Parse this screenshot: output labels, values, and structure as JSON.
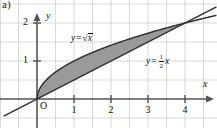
{
  "figure": {
    "part_label": "a)",
    "axis_labels": {
      "x": "x",
      "y": "y"
    },
    "origin_label": "O"
  },
  "chart_data": {
    "type": "line",
    "title": "",
    "xlabel": "x",
    "ylabel": "y",
    "xlim": [
      -0.9,
      4.85
    ],
    "ylim": [
      -0.75,
      2.55
    ],
    "xticks": [
      1,
      2,
      3,
      4
    ],
    "xtick_labels": [
      "1",
      "2",
      "3",
      "4"
    ],
    "yticks": [
      1,
      2
    ],
    "ytick_labels": [
      "1",
      "2"
    ],
    "grid": true,
    "grid_step": 0.5,
    "grid_color": "#cfcfcf",
    "axis_color": "#555555",
    "curve_color": "#333333",
    "shade_color": "#9a9a9a",
    "background": "#ffffff",
    "legend": "inline-annotations",
    "series": [
      {
        "name": "y = sqrt(x)",
        "label_text": "y = √x",
        "label_parts": {
          "lhs": "y",
          "op": "=",
          "radicand": "x"
        },
        "expression": "sqrt(x)",
        "domain": [
          0,
          4.8
        ],
        "points": [
          {
            "x": 0,
            "y": 0
          },
          {
            "x": 0.25,
            "y": 0.5
          },
          {
            "x": 0.5,
            "y": 0.707
          },
          {
            "x": 1,
            "y": 1
          },
          {
            "x": 1.5,
            "y": 1.225
          },
          {
            "x": 2,
            "y": 1.414
          },
          {
            "x": 2.5,
            "y": 1.581
          },
          {
            "x": 3,
            "y": 1.732
          },
          {
            "x": 3.5,
            "y": 1.871
          },
          {
            "x": 4,
            "y": 2
          },
          {
            "x": 4.5,
            "y": 2.121
          },
          {
            "x": 4.8,
            "y": 2.191
          }
        ]
      },
      {
        "name": "y = (1/2)x",
        "label_text": "y = ½x",
        "label_parts": {
          "lhs": "y",
          "op": "=",
          "num": "1",
          "den": "2",
          "var": "x"
        },
        "expression": "0.5*x",
        "domain": [
          -0.9,
          4.85
        ],
        "points": [
          {
            "x": -0.9,
            "y": -0.45
          },
          {
            "x": 0,
            "y": 0
          },
          {
            "x": 4,
            "y": 2
          },
          {
            "x": 4.85,
            "y": 2.425
          }
        ]
      }
    ],
    "shaded_region": {
      "label": "area between y = sqrt(x) and y = x/2",
      "upper": "sqrt(x)",
      "lower": "0.5*x",
      "from_x": 0,
      "to_x": 4,
      "fill": "#9a9a9a"
    },
    "intersections": [
      {
        "x": 0,
        "y": 0
      },
      {
        "x": 4,
        "y": 2
      }
    ]
  }
}
